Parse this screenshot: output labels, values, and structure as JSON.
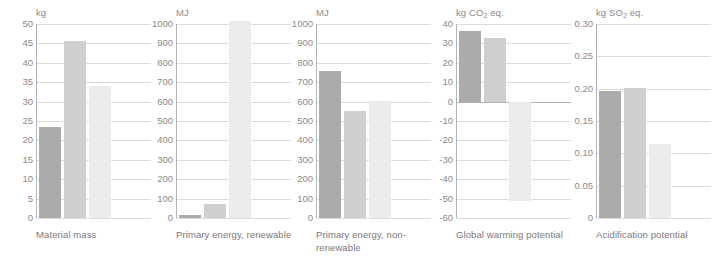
{
  "figure": {
    "series_names": [
      "Series 1",
      "Series 2",
      "Series 3"
    ],
    "series_colors": [
      "#ababab",
      "#cfcfcf",
      "#ececec"
    ],
    "grid_color": "#dcdcdc",
    "axis_color": "#b5b5b5",
    "text_color": "#8a8a8a"
  },
  "chart_data": [
    {
      "type": "bar",
      "title": "Material mass",
      "ylabel": "kg",
      "xlabel": "",
      "categories": [
        "Material mass"
      ],
      "series": [
        {
          "name": "Series 1",
          "values": [
            23.5
          ],
          "color": "#ababab"
        },
        {
          "name": "Series 2",
          "values": [
            45.5
          ],
          "color": "#cfcfcf"
        },
        {
          "name": "Series 3",
          "values": [
            34.0
          ],
          "color": "#ececec"
        }
      ],
      "ylim": [
        0,
        50
      ],
      "yticks": [
        0,
        5,
        10,
        15,
        20,
        25,
        30,
        35,
        40,
        45,
        50
      ],
      "ytick_labels": [
        "0",
        "5",
        "10",
        "15",
        "20",
        "25",
        "30",
        "35",
        "40",
        "45",
        "50"
      ],
      "grid": true,
      "legend": "none"
    },
    {
      "type": "bar",
      "title": "Primary energy, renewable",
      "ylabel": "MJ",
      "xlabel": "",
      "categories": [
        "Primary energy, renewable"
      ],
      "series": [
        {
          "name": "Series 1",
          "values": [
            18
          ],
          "color": "#ababab"
        },
        {
          "name": "Series 2",
          "values": [
            70
          ],
          "color": "#cfcfcf"
        },
        {
          "name": "Series 3",
          "values": [
            1015
          ],
          "color": "#ececec"
        }
      ],
      "ylim": [
        0,
        1000
      ],
      "yticks": [
        0,
        100,
        200,
        300,
        400,
        500,
        600,
        700,
        800,
        900,
        1000
      ],
      "ytick_labels": [
        "0",
        "100",
        "200",
        "300",
        "400",
        "500",
        "600",
        "700",
        "800",
        "900",
        "1000"
      ],
      "grid": true,
      "legend": "none"
    },
    {
      "type": "bar",
      "title": "Primary energy, non-renewable",
      "ylabel": "MJ",
      "xlabel": "",
      "categories": [
        "Primary energy, non-renewable"
      ],
      "series": [
        {
          "name": "Series 1",
          "values": [
            757
          ],
          "color": "#ababab"
        },
        {
          "name": "Series 2",
          "values": [
            553
          ],
          "color": "#cfcfcf"
        },
        {
          "name": "Series 3",
          "values": [
            605
          ],
          "color": "#ececec"
        }
      ],
      "ylim": [
        0,
        1000
      ],
      "yticks": [
        0,
        100,
        200,
        300,
        400,
        500,
        600,
        700,
        800,
        900,
        1000
      ],
      "ytick_labels": [
        "0",
        "100",
        "200",
        "300",
        "400",
        "500",
        "600",
        "700",
        "800",
        "900",
        "1000"
      ],
      "grid": true,
      "legend": "none"
    },
    {
      "type": "bar",
      "title": "Global warming potential",
      "ylabel": "kg CO2 eq.",
      "xlabel": "",
      "categories": [
        "Global warming potential"
      ],
      "series": [
        {
          "name": "Series 1",
          "values": [
            36.5
          ],
          "color": "#ababab"
        },
        {
          "name": "Series 2",
          "values": [
            33.0
          ],
          "color": "#cfcfcf"
        },
        {
          "name": "Series 3",
          "values": [
            -51.0
          ],
          "color": "#ececec"
        }
      ],
      "ylim": [
        -60,
        40
      ],
      "yticks": [
        -60,
        -50,
        -40,
        -30,
        -20,
        -10,
        0,
        10,
        20,
        30,
        40
      ],
      "ytick_labels": [
        "-60",
        "-50",
        "-40",
        "-30",
        "-20",
        "-10",
        "0",
        "10",
        "20",
        "30",
        "40"
      ],
      "grid": true,
      "legend": "none"
    },
    {
      "type": "bar",
      "title": "Acidification potential",
      "ylabel": "kg SO2 eq.",
      "xlabel": "",
      "categories": [
        "Acidification potential"
      ],
      "series": [
        {
          "name": "Series 1",
          "values": [
            0.197
          ],
          "color": "#ababab"
        },
        {
          "name": "Series 2",
          "values": [
            0.2005
          ],
          "color": "#cfcfcf"
        },
        {
          "name": "Series 3",
          "values": [
            0.115
          ],
          "color": "#ececec"
        }
      ],
      "ylim": [
        0,
        0.3
      ],
      "yticks": [
        0,
        0.05,
        0.1,
        0.15,
        0.2,
        0.25,
        0.3
      ],
      "ytick_labels": [
        "0",
        "0.05",
        "0.10",
        "0.15",
        "0.20",
        "0.25",
        "0.30"
      ],
      "grid": true,
      "legend": "none"
    }
  ],
  "panels": [
    {
      "unit_main": "kg",
      "unit_sub": "",
      "unit_tail": "",
      "caption": "Material mass"
    },
    {
      "unit_main": "MJ",
      "unit_sub": "",
      "unit_tail": "",
      "caption": "Primary energy, renewable"
    },
    {
      "unit_main": "MJ",
      "unit_sub": "",
      "unit_tail": "",
      "caption": "Primary energy, non-renewable"
    },
    {
      "unit_main": "kg CO",
      "unit_sub": "2",
      "unit_tail": " eq.",
      "caption": "Global warming potential"
    },
    {
      "unit_main": "kg SO",
      "unit_sub": "2",
      "unit_tail": " eq.",
      "caption": "Acidification potential"
    }
  ]
}
